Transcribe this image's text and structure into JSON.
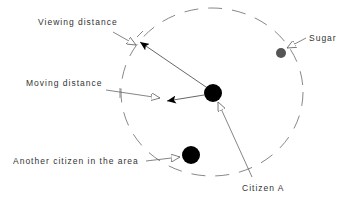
{
  "labels": {
    "viewing_distance": "Viewing distance",
    "moving_distance": "Moving distance",
    "another_citizen": "Another citizen in the area",
    "citizen_a": "Citizen A",
    "sugar": "Sugar"
  },
  "colors": {
    "citizen": "#000000",
    "sugar": "#555555",
    "line": "#555555",
    "dash": "#888888",
    "text": "#333333"
  }
}
